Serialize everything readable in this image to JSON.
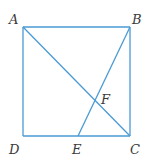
{
  "figure": {
    "type": "geometry",
    "line_color": "#4a9ad4",
    "label_color": "#3a3a3a",
    "points": {
      "A": {
        "label": "A"
      },
      "B": {
        "label": "B"
      },
      "C": {
        "label": "C"
      },
      "D": {
        "label": "D"
      },
      "E": {
        "label": "E"
      },
      "F": {
        "label": "F"
      }
    },
    "segments": [
      {
        "name": "AB",
        "from": "A",
        "to": "B"
      },
      {
        "name": "BC",
        "from": "B",
        "to": "C"
      },
      {
        "name": "CD",
        "from": "C",
        "to": "D"
      },
      {
        "name": "DA",
        "from": "D",
        "to": "A"
      },
      {
        "name": "AC",
        "from": "A",
        "to": "C"
      },
      {
        "name": "BE",
        "from": "B",
        "to": "E"
      }
    ]
  }
}
